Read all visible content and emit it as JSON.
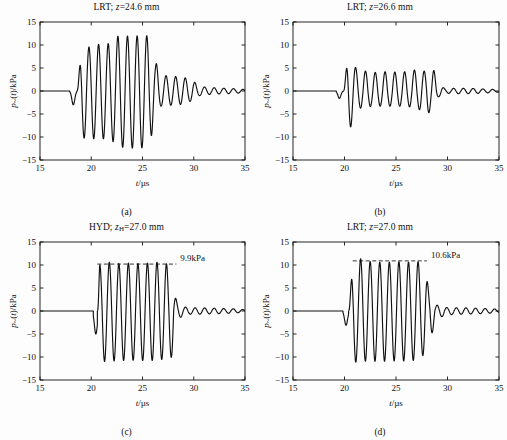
{
  "figure": {
    "panel_count": 4,
    "background": "#fdfdfd",
    "trace_color": "#111111",
    "axis_color": "#111111"
  },
  "axes": {
    "xlabel_var": "t",
    "xlabel_unit": "/µs",
    "ylabel": "p~(t)/kPa",
    "ylabel_var": "p",
    "ylabel_rest": "(t)/kPa",
    "xlim": [
      15,
      35
    ],
    "ylim": [
      -15,
      15
    ],
    "xticks": [
      "15",
      "20",
      "25",
      "30",
      "35"
    ],
    "yticks": [
      "15",
      "10",
      "5",
      "0",
      "−5",
      "−10",
      "−15"
    ],
    "xtick_values": [
      15,
      20,
      25,
      30,
      35
    ],
    "ytick_values": [
      15,
      10,
      5,
      0,
      -5,
      -10,
      -15
    ],
    "grid": false
  },
  "panels": [
    {
      "id": "a",
      "caption": "(a)",
      "title_prefix": "LRT; ",
      "title_var": "z",
      "title_sub": "",
      "title_value": "=24.6 mm",
      "title_full": "LRT; z=24.6 mm",
      "sensor": "LRT",
      "z_mm": 24.6,
      "annotation": null
    },
    {
      "id": "b",
      "caption": "(b)",
      "title_prefix": "LRT; ",
      "title_var": "z",
      "title_sub": "",
      "title_value": "=26.6 mm",
      "title_full": "LRT; z=26.6 mm",
      "sensor": "LRT",
      "z_mm": 26.6,
      "annotation": null
    },
    {
      "id": "c",
      "caption": "(c)",
      "title_prefix": "HYD; ",
      "title_var": "z",
      "title_sub": "H",
      "title_value": "=27.0 mm",
      "title_full": "HYD; zH=27.0 mm",
      "sensor": "HYD",
      "z_mm": 27.0,
      "annotation": {
        "label": "9.9kPa",
        "level": 10.2,
        "x_start": 20.6,
        "x_end": 28.3
      }
    },
    {
      "id": "d",
      "caption": "(d)",
      "title_prefix": "LRT; ",
      "title_var": "z",
      "title_sub": "",
      "title_value": "=27.0 mm",
      "title_full": "LRT; z=27.0 mm",
      "sensor": "LRT",
      "z_mm": 27.0,
      "annotation": {
        "label": "10.6kPa",
        "level": 10.9,
        "x_start": 20.8,
        "x_end": 28.0
      }
    }
  ],
  "chart_data": [
    {
      "type": "line",
      "panel": "a",
      "title": "LRT; z=24.6 mm",
      "xlabel": "t/µs",
      "ylabel": "p~(t)/kPa",
      "xlim": [
        15,
        35
      ],
      "ylim": [
        -15,
        15
      ],
      "grid": false,
      "period_us": 0.94,
      "quiet_until": 17.9,
      "precursor": {
        "t": 18.25,
        "amp": -3.0
      },
      "envelope_nodes": [
        {
          "t": 18.6,
          "pos": 0.2,
          "neg": -0.2
        },
        {
          "t": 19.1,
          "pos": 9.3,
          "neg": -10.2
        },
        {
          "t": 20.0,
          "pos": 9.6,
          "neg": -10.4
        },
        {
          "t": 20.9,
          "pos": 10.2,
          "neg": -10.3
        },
        {
          "t": 21.8,
          "pos": 10.3,
          "neg": -10.6
        },
        {
          "t": 22.8,
          "pos": 12.1,
          "neg": -12.2
        },
        {
          "t": 23.8,
          "pos": 11.9,
          "neg": -12.4
        },
        {
          "t": 24.8,
          "pos": 12.0,
          "neg": -12.5
        },
        {
          "t": 25.8,
          "pos": 12.0,
          "neg": -10.0
        },
        {
          "t": 26.3,
          "pos": 6.0,
          "neg": -5.0
        },
        {
          "t": 26.9,
          "pos": 3.4,
          "neg": -3.2
        },
        {
          "t": 27.9,
          "pos": 3.2,
          "neg": -3.1
        },
        {
          "t": 28.9,
          "pos": 3.0,
          "neg": -2.9
        },
        {
          "t": 29.8,
          "pos": 2.3,
          "neg": -2.2
        },
        {
          "t": 30.6,
          "pos": 1.0,
          "neg": -1.0
        },
        {
          "t": 31.5,
          "pos": 0.75,
          "neg": -0.75
        },
        {
          "t": 33.0,
          "pos": 0.6,
          "neg": -0.6
        },
        {
          "t": 34.5,
          "pos": 0.45,
          "neg": -0.45
        },
        {
          "t": 35.0,
          "pos": 0.3,
          "neg": -0.3
        }
      ],
      "max_positive_kPa": 12.1,
      "min_negative_kPa": -12.5
    },
    {
      "type": "line",
      "panel": "b",
      "title": "LRT; z=26.6 mm",
      "xlabel": "t/µs",
      "ylabel": "p~(t)/kPa",
      "xlim": [
        15,
        35
      ],
      "ylim": [
        -15,
        15
      ],
      "grid": false,
      "period_us": 0.95,
      "quiet_until": 19.2,
      "precursor": {
        "t": 19.5,
        "amp": -1.6
      },
      "envelope_nodes": [
        {
          "t": 19.9,
          "pos": 0.4,
          "neg": -0.4
        },
        {
          "t": 20.4,
          "pos": 8.0,
          "neg": -8.4
        },
        {
          "t": 21.3,
          "pos": 4.6,
          "neg": -3.8
        },
        {
          "t": 22.2,
          "pos": 4.3,
          "neg": -3.4
        },
        {
          "t": 23.2,
          "pos": 4.0,
          "neg": -3.3
        },
        {
          "t": 24.1,
          "pos": 4.2,
          "neg": -3.3
        },
        {
          "t": 25.1,
          "pos": 4.1,
          "neg": -3.3
        },
        {
          "t": 26.0,
          "pos": 4.2,
          "neg": -3.4
        },
        {
          "t": 27.0,
          "pos": 4.6,
          "neg": -3.6
        },
        {
          "t": 27.9,
          "pos": 4.3,
          "neg": -5.7
        },
        {
          "t": 28.6,
          "pos": 4.6,
          "neg": -3.2
        },
        {
          "t": 29.2,
          "pos": 1.4,
          "neg": -1.2
        },
        {
          "t": 29.8,
          "pos": 0.5,
          "neg": -0.5
        },
        {
          "t": 31.0,
          "pos": 0.6,
          "neg": -0.6
        },
        {
          "t": 32.5,
          "pos": 0.55,
          "neg": -0.55
        },
        {
          "t": 34.0,
          "pos": 0.4,
          "neg": -0.4
        },
        {
          "t": 35.0,
          "pos": 0.25,
          "neg": -0.25
        }
      ],
      "max_positive_kPa": 8.0,
      "min_negative_kPa": -8.4
    },
    {
      "type": "line",
      "panel": "c",
      "title": "HYD; zH=27.0 mm",
      "xlabel": "t/µs",
      "ylabel": "p~(t)/kPa",
      "xlim": [
        15,
        35
      ],
      "ylim": [
        -15,
        15
      ],
      "grid": false,
      "period_us": 0.93,
      "quiet_until": 20.2,
      "precursor": {
        "t": 20.45,
        "amp": -5.0
      },
      "reference_line_kPa": 10.2,
      "reference_label": "9.9kPa",
      "envelope_nodes": [
        {
          "t": 20.6,
          "pos": 0.5,
          "neg": -0.5
        },
        {
          "t": 20.85,
          "pos": 10.1,
          "neg": -11.0
        },
        {
          "t": 21.75,
          "pos": 10.6,
          "neg": -10.9
        },
        {
          "t": 22.7,
          "pos": 10.3,
          "neg": -10.8
        },
        {
          "t": 23.6,
          "pos": 10.4,
          "neg": -10.7
        },
        {
          "t": 24.5,
          "pos": 10.3,
          "neg": -10.7
        },
        {
          "t": 25.4,
          "pos": 10.4,
          "neg": -10.8
        },
        {
          "t": 26.4,
          "pos": 10.6,
          "neg": -10.7
        },
        {
          "t": 27.3,
          "pos": 10.3,
          "neg": -10.4
        },
        {
          "t": 28.0,
          "pos": 3.9,
          "neg": -10.0
        },
        {
          "t": 28.5,
          "pos": 1.6,
          "neg": -1.5
        },
        {
          "t": 29.0,
          "pos": 0.9,
          "neg": -1.2
        },
        {
          "t": 29.6,
          "pos": 0.7,
          "neg": -0.7
        },
        {
          "t": 30.5,
          "pos": 0.7,
          "neg": -0.7
        },
        {
          "t": 32.0,
          "pos": 0.6,
          "neg": -0.6
        },
        {
          "t": 33.5,
          "pos": 0.5,
          "neg": -0.5
        },
        {
          "t": 35.0,
          "pos": 0.3,
          "neg": -0.3
        }
      ],
      "max_positive_kPa": 10.6,
      "min_negative_kPa": -11.0
    },
    {
      "type": "line",
      "panel": "d",
      "title": "LRT; z=27.0 mm",
      "xlabel": "t/µs",
      "ylabel": "p~(t)/kPa",
      "xlim": [
        15,
        35
      ],
      "ylim": [
        -15,
        15
      ],
      "grid": false,
      "period_us": 0.93,
      "quiet_until": 19.85,
      "precursor": {
        "t": 20.15,
        "amp": -3.1
      },
      "reference_line_kPa": 10.9,
      "reference_label": "10.6kPa",
      "envelope_nodes": [
        {
          "t": 20.4,
          "pos": 0.5,
          "neg": -0.5
        },
        {
          "t": 20.8,
          "pos": 9.0,
          "neg": -11.2
        },
        {
          "t": 21.7,
          "pos": 11.5,
          "neg": -10.9
        },
        {
          "t": 22.6,
          "pos": 10.7,
          "neg": -10.9
        },
        {
          "t": 23.5,
          "pos": 10.6,
          "neg": -11.0
        },
        {
          "t": 24.4,
          "pos": 10.6,
          "neg": -10.8
        },
        {
          "t": 25.3,
          "pos": 10.7,
          "neg": -10.9
        },
        {
          "t": 26.2,
          "pos": 10.6,
          "neg": -10.8
        },
        {
          "t": 27.1,
          "pos": 10.7,
          "neg": -10.7
        },
        {
          "t": 27.7,
          "pos": 10.5,
          "neg": -9.6
        },
        {
          "t": 28.3,
          "pos": 3.8,
          "neg": -5.8
        },
        {
          "t": 28.9,
          "pos": 1.3,
          "neg": -2.3
        },
        {
          "t": 29.5,
          "pos": 0.8,
          "neg": -1.2
        },
        {
          "t": 30.3,
          "pos": 0.7,
          "neg": -0.8
        },
        {
          "t": 31.5,
          "pos": 0.7,
          "neg": -0.7
        },
        {
          "t": 33.0,
          "pos": 0.6,
          "neg": -0.6
        },
        {
          "t": 34.5,
          "pos": 0.45,
          "neg": -0.45
        },
        {
          "t": 35.0,
          "pos": 0.3,
          "neg": -0.3
        }
      ],
      "max_positive_kPa": 11.5,
      "min_negative_kPa": -11.2
    }
  ]
}
